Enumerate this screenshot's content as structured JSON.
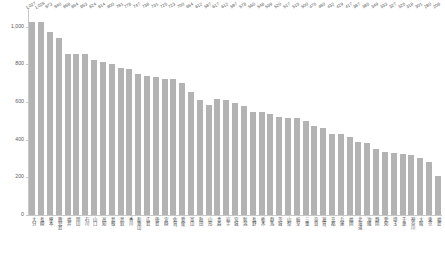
{
  "chart_data": {
    "type": "bar",
    "title": "",
    "subtitle": "",
    "xlabel": "",
    "ylabel": "",
    "ylim": [
      0,
      1100
    ],
    "grid": false,
    "legend": null,
    "orientation": "vertical",
    "bar_color": "#b3b3b3",
    "axis_color": "#c8c8c8",
    "label_color": "#4d4d4d",
    "y_ticks": [
      0,
      200,
      400,
      600,
      800,
      1000
    ],
    "y_tick_labels": [
      "0",
      "200",
      "400",
      "600",
      "800",
      "1,000"
    ],
    "categories": [
      "大分",
      "長崎",
      "熊本",
      "鹿児島",
      "福井",
      "岡山",
      "石川",
      "山口",
      "高知",
      "島根",
      "鳥取",
      "香川",
      "和歌山",
      "広島",
      "徳島",
      "宮崎",
      "佐賀",
      "愛媛",
      "富山",
      "秋田",
      "山形",
      "青森",
      "岩手",
      "宮城",
      "新潟",
      "長野",
      "栃木",
      "群馬",
      "茨城",
      "山梨",
      "岐阜",
      "三重",
      "奈良",
      "滋賀",
      "京都",
      "兵庫",
      "福岡",
      "北海道",
      "沖縄",
      "静岡",
      "愛知",
      "埼玉",
      "千葉",
      "神奈川",
      "大阪",
      "東京",
      "福島"
    ],
    "values": [
      1027,
      1026,
      973,
      940,
      858,
      854,
      853,
      824,
      814,
      800,
      781,
      778,
      747,
      738,
      731,
      725,
      723,
      700,
      654,
      612,
      587,
      617,
      612,
      597,
      578,
      550,
      548,
      539,
      520,
      517,
      515,
      500,
      475,
      460,
      432,
      429,
      417,
      387,
      385,
      349,
      333,
      327,
      325,
      318,
      301,
      280,
      208
    ],
    "value_labels": [
      "1,027",
      "1,026",
      "973",
      "940",
      "858",
      "854",
      "853",
      "824",
      "814",
      "800",
      "781",
      "778",
      "747",
      "738",
      "731",
      "725",
      "723",
      "700",
      "654",
      "612",
      "587",
      "617",
      "612",
      "597",
      "578",
      "550",
      "548",
      "539",
      "520",
      "517",
      "515",
      "500",
      "475",
      "460",
      "432",
      "429",
      "417",
      "387",
      "385",
      "349",
      "333",
      "327",
      "325",
      "318",
      "301",
      "280",
      "208"
    ]
  }
}
